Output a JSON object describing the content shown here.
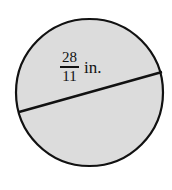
{
  "figure": {
    "type": "geometry-diagram",
    "shape_name": "circle",
    "background_color": "#ffffff",
    "circle": {
      "fill_color": "#dcdcdc",
      "stroke_color": "#111111",
      "stroke_width": 2.2,
      "center_x": 89.5,
      "center_y": 92.5,
      "radius": 73.5
    },
    "diameter_segment": {
      "name": "diameter",
      "stroke_color": "#111111",
      "stroke_width": 2.4,
      "x1": 19,
      "y1": 112,
      "x2": 162,
      "y2": 72
    },
    "label": {
      "name": "diameter-measure",
      "numerator": "28",
      "denominator": "11",
      "unit": "in.",
      "full_text": "28/11 in.",
      "color": "#111111"
    }
  }
}
